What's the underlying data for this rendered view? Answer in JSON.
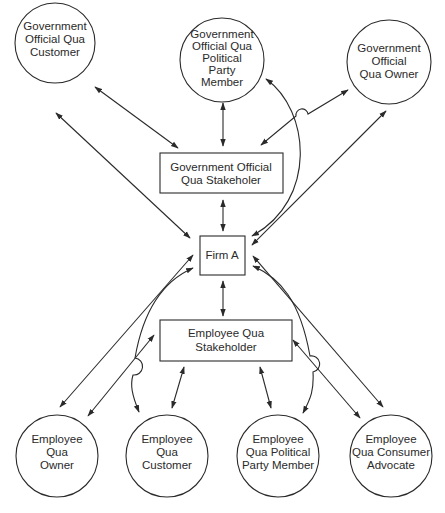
{
  "diagram": {
    "type": "stakeholder-relationship",
    "colors": {
      "stroke": "#2a2a2a",
      "background": "#ffffff",
      "text": "#2a2a2a"
    },
    "nodes": {
      "gov_customer": {
        "shape": "circle",
        "lines": [
          "Government",
          "Official Qua",
          "Customer"
        ]
      },
      "gov_party": {
        "shape": "circle",
        "lines": [
          "Government",
          "Official Qua",
          "Political",
          "Party",
          "Member"
        ]
      },
      "gov_owner": {
        "shape": "circle",
        "lines": [
          "Government",
          "Official",
          "Qua Owner"
        ]
      },
      "gov_stakeholder": {
        "shape": "rect",
        "lines": [
          "Government Official",
          "Qua Stakeholer"
        ]
      },
      "firm": {
        "shape": "rect",
        "lines": [
          "Firm A"
        ]
      },
      "emp_stakeholder": {
        "shape": "rect",
        "lines": [
          "Employee Qua",
          "Stakeholder"
        ]
      },
      "emp_owner": {
        "shape": "circle",
        "lines": [
          "Employee",
          "Qua",
          "Owner"
        ]
      },
      "emp_customer": {
        "shape": "circle",
        "lines": [
          "Employee",
          "Qua",
          "Customer"
        ]
      },
      "emp_party": {
        "shape": "circle",
        "lines": [
          "Employee",
          "Qua Political",
          "Party Member"
        ]
      },
      "emp_advocate": {
        "shape": "circle",
        "lines": [
          "Employee",
          "Qua Consumer",
          "Advocate"
        ]
      }
    },
    "edges": [
      {
        "from": "gov_customer",
        "to": "gov_stakeholder",
        "direction": "both"
      },
      {
        "from": "gov_customer",
        "to": "firm",
        "direction": "both"
      },
      {
        "from": "gov_party",
        "to": "gov_stakeholder",
        "direction": "both"
      },
      {
        "from": "gov_party",
        "to": "firm",
        "direction": "both",
        "curved": true
      },
      {
        "from": "gov_owner",
        "to": "gov_stakeholder",
        "direction": "both",
        "hop": true
      },
      {
        "from": "gov_owner",
        "to": "firm",
        "direction": "both"
      },
      {
        "from": "gov_stakeholder",
        "to": "firm",
        "direction": "both"
      },
      {
        "from": "firm",
        "to": "emp_stakeholder",
        "direction": "both"
      },
      {
        "from": "emp_owner",
        "to": "firm",
        "direction": "both"
      },
      {
        "from": "emp_owner",
        "to": "emp_stakeholder",
        "direction": "both"
      },
      {
        "from": "emp_customer",
        "to": "firm",
        "direction": "both",
        "curved": true,
        "hop": true
      },
      {
        "from": "emp_customer",
        "to": "emp_stakeholder",
        "direction": "both"
      },
      {
        "from": "emp_party",
        "to": "firm",
        "direction": "both",
        "curved": true,
        "hop": true
      },
      {
        "from": "emp_party",
        "to": "emp_stakeholder",
        "direction": "both"
      },
      {
        "from": "emp_advocate",
        "to": "firm",
        "direction": "both"
      },
      {
        "from": "emp_advocate",
        "to": "emp_stakeholder",
        "direction": "both"
      }
    ]
  }
}
